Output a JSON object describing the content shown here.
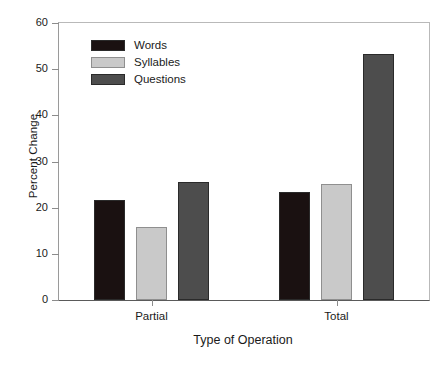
{
  "chart_data": {
    "type": "bar",
    "title": "",
    "xlabel": "Type of Operation",
    "ylabel": "Percent Change",
    "categories": [
      "Partial",
      "Total"
    ],
    "series": [
      {
        "name": "Words",
        "color": "#1a1111",
        "values": [
          21.6,
          23.4
        ]
      },
      {
        "name": "Syllables",
        "color": "#c9c9c9",
        "values": [
          15.8,
          25.1
        ]
      },
      {
        "name": "Questions",
        "color": "#4d4d4d",
        "values": [
          25.5,
          53.2
        ]
      }
    ],
    "ylim": [
      0,
      60
    ],
    "yticks": [
      0,
      10,
      20,
      30,
      40,
      50,
      60
    ],
    "ytick_labels": [
      "0",
      "10",
      "20",
      "30",
      "40",
      "50",
      "60"
    ],
    "grid": false,
    "legend_position": "upper left",
    "frame": true
  },
  "legend": {
    "items": [
      {
        "label": "Words"
      },
      {
        "label": "Syllables"
      },
      {
        "label": "Questions"
      }
    ]
  },
  "axes": {
    "y_title": "Percent Change",
    "x_title": "Type of Operation"
  }
}
